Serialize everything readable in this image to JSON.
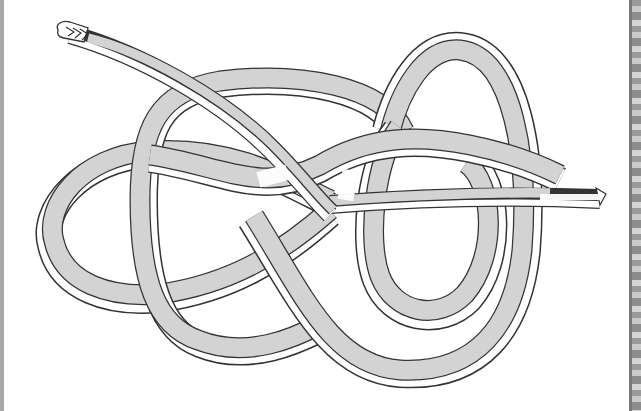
{
  "illustration": {
    "subject": "knotted strap line drawing",
    "colors": {
      "background": "#ffffff",
      "strap_fill": "#d3d3d3",
      "strap_edge": "#ffffff",
      "outline": "#333333",
      "frame_left": "#a8a8a8",
      "frame_right": "#9a9a9a"
    }
  }
}
